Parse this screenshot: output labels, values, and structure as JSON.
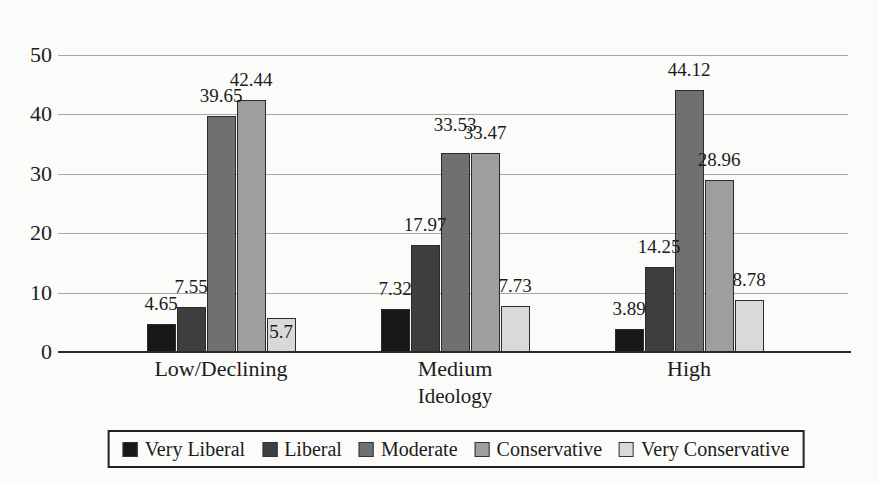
{
  "figure": {
    "background_color": "#fbfbf9",
    "text_color": "#1c1c1c"
  },
  "chart_data": {
    "type": "bar",
    "title": "",
    "xlabel": "Ideology",
    "ylabel": "",
    "ylim": [
      0,
      50
    ],
    "yticks": [
      0,
      10,
      20,
      30,
      40,
      50
    ],
    "grid": true,
    "gridline_color": "#a6a6a6",
    "axis_color": "#2a2a2a",
    "bar_outline_color": "#2b2b2b",
    "legend_position": "bottom",
    "legend_border_color": "#222222",
    "categories": [
      "Low/Declining",
      "Medium",
      "High"
    ],
    "series": [
      {
        "name": "Very Liberal",
        "color": "#171717",
        "values": [
          4.65,
          7.32,
          3.89
        ]
      },
      {
        "name": "Liberal",
        "color": "#3e3e3e",
        "values": [
          7.55,
          17.97,
          14.25
        ]
      },
      {
        "name": "Moderate",
        "color": "#707070",
        "values": [
          39.65,
          33.53,
          44.12
        ]
      },
      {
        "name": "Conservative",
        "color": "#9e9e9e",
        "values": [
          42.44,
          33.47,
          28.96
        ]
      },
      {
        "name": "Very Conservative",
        "color": "#d9d9d9",
        "values": [
          5.7,
          7.73,
          8.78
        ]
      }
    ],
    "data_labels_shown": true,
    "label_placement_overrides": [
      {
        "series_index": 4,
        "category_index": 0,
        "placement": "inside"
      },
      {
        "series_index": 2,
        "category_index": 1,
        "shift_up_px": 8
      }
    ]
  }
}
